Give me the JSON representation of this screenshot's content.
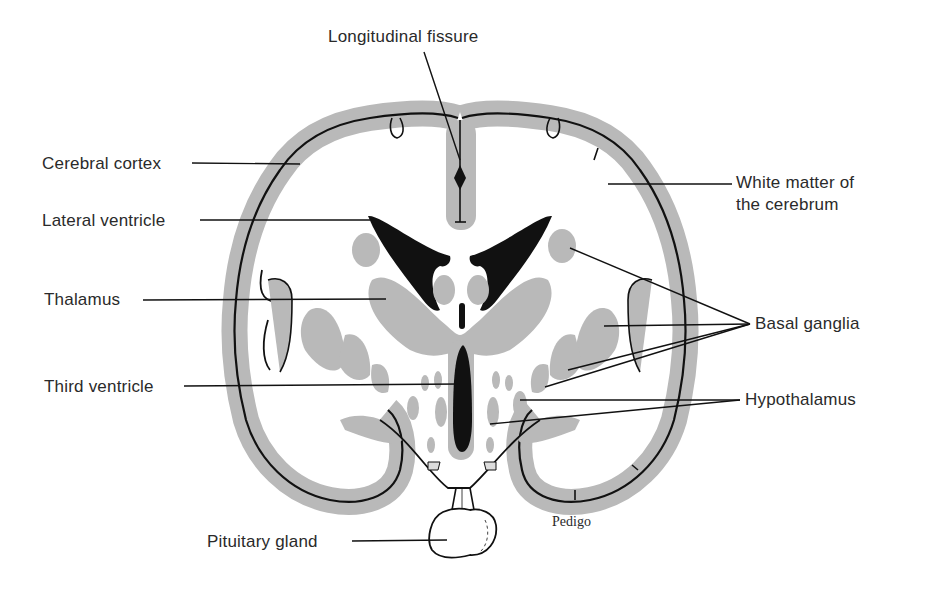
{
  "diagram": {
    "colors": {
      "gray_matter": "#b9b9b9",
      "ventricle": "#111111",
      "outline": "#111111",
      "background": "#ffffff",
      "text": "#2a2a2a"
    },
    "labels": {
      "longitudinal_fissure": "Longitudinal fissure",
      "cerebral_cortex": "Cerebral cortex",
      "lateral_ventricle": "Lateral ventricle",
      "thalamus": "Thalamus",
      "third_ventricle": "Third ventricle",
      "pituitary_gland": "Pituitary gland",
      "white_matter_line1": "White matter of",
      "white_matter_line2": "the cerebrum",
      "basal_ganglia": "Basal ganglia",
      "hypothalamus": "Hypothalamus"
    },
    "credit": "Pedigo"
  }
}
